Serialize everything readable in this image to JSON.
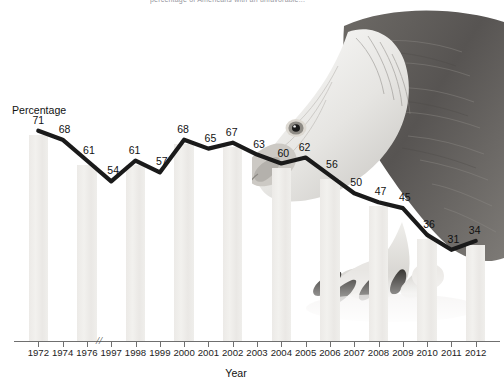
{
  "figure": {
    "top_clipped_caption": "percentage of Americans with an unfavorable...",
    "y_axis_title": "Percentage",
    "x_axis_title": "Year",
    "axis_break_marker": "//",
    "eagle_photo_alt": "bald-eagle-photograph",
    "colors": {
      "bar": "#eeedea",
      "line": "#1a1a1a",
      "axis": "#6f6f6f",
      "text": "#111111",
      "background": "#ffffff"
    }
  },
  "chart_data": {
    "type": "line",
    "title": "",
    "xlabel": "Year",
    "ylabel": "Percentage",
    "ylim": [
      0,
      80
    ],
    "grid": false,
    "legend": "none",
    "axis_break_after": "1976",
    "categories": [
      "1972",
      "1974",
      "1976",
      "1997",
      "1998",
      "1999",
      "2000",
      "2001",
      "2002",
      "2003",
      "2004",
      "2005",
      "2006",
      "2007",
      "2008",
      "2009",
      "2010",
      "2011",
      "2012"
    ],
    "values": [
      71,
      68,
      61,
      54,
      61,
      57,
      68,
      65,
      67,
      63,
      60,
      62,
      56,
      50,
      47,
      45,
      36,
      31,
      34
    ],
    "point_labels": [
      "71",
      "68",
      "61",
      "54",
      "61",
      "57",
      "68",
      "65",
      "67",
      "63",
      "60",
      "62",
      "56",
      "50",
      "47",
      "45",
      "36",
      "31",
      "34"
    ],
    "bars": {
      "shown_for": [
        "1972",
        "1976",
        "1998",
        "2000",
        "2002",
        "2004",
        "2006",
        "2008",
        "2010",
        "2012"
      ],
      "style": "light-gray vertical bands behind line"
    }
  }
}
